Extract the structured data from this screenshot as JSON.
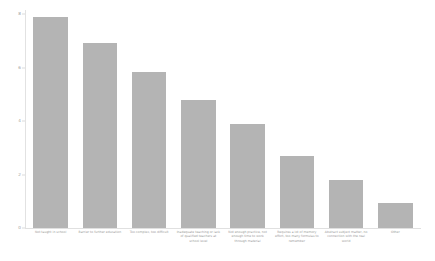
{
  "chart_data": {
    "type": "bar",
    "title": "",
    "subtitle": "",
    "xlabel": "",
    "ylabel": "",
    "ylim": [
      0,
      8
    ],
    "yticks": [
      0,
      2,
      4,
      6,
      8
    ],
    "ytick_labels": [
      "0",
      "2",
      "4",
      "6",
      "8"
    ],
    "grid": false,
    "legend": false,
    "legend_position": "none",
    "bar_color": "#b4b4b4",
    "background_color": "#ffffff",
    "axis_color": "#e0e0e0",
    "tick_label_color": "#9a9a9a",
    "categories": [
      "Not taught in school",
      "Barrier to further education",
      "Too complex, too difficult",
      "Inadequate teaching or lack of qualified teachers at school level",
      "Not enough practice, not enough time to work through material",
      "Requires a lot of memory effort, too many formulas to remember",
      "Abstract subject matter, no connection with the real world",
      "Other"
    ],
    "categories_short": [
      "not-taught-in-school",
      "barrier-to-further-education",
      "too-complex-too-difficult",
      "inadequate-teaching",
      "not-enough-practice",
      "requires-memory-effort",
      "abstract-subject-matter",
      "other"
    ],
    "values": [
      7.9,
      6.9,
      5.85,
      4.8,
      3.9,
      2.7,
      1.8,
      0.95
    ]
  }
}
